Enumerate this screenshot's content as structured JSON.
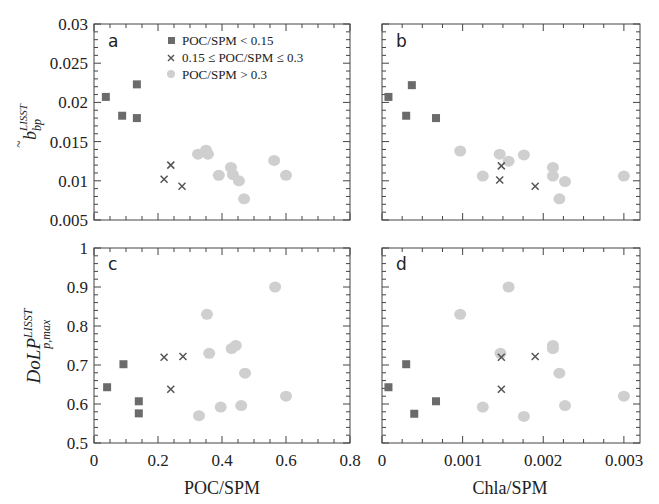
{
  "chart_data": [
    {
      "panel": "a",
      "type": "scatter",
      "xlabel": "",
      "ylabel": "b̃bp LISST",
      "xlim": [
        0,
        0.8
      ],
      "ylim": [
        0.005,
        0.03
      ],
      "xticks": [
        "0",
        "0.2",
        "0.4",
        "0.6",
        "0.8"
      ],
      "yticks": [
        "0.005",
        "0.01",
        "0.015",
        "0.02",
        "0.025",
        "0.03"
      ],
      "series": [
        {
          "name": "POC/SPM < 0.15",
          "marker": "square",
          "points": [
            [
              0.037,
              0.0207
            ],
            [
              0.088,
              0.0183
            ],
            [
              0.134,
              0.018
            ],
            [
              0.134,
              0.0223
            ]
          ]
        },
        {
          "name": "0.15 ≤ POC/SPM ≤ 0.3",
          "marker": "x",
          "points": [
            [
              0.219,
              0.0102
            ],
            [
              0.24,
              0.012
            ],
            [
              0.275,
              0.0093
            ]
          ]
        },
        {
          "name": "POC/SPM > 0.3",
          "marker": "circle",
          "points": [
            [
              0.325,
              0.0134
            ],
            [
              0.35,
              0.0139
            ],
            [
              0.356,
              0.0134
            ],
            [
              0.39,
              0.0107
            ],
            [
              0.428,
              0.0117
            ],
            [
              0.434,
              0.0108
            ],
            [
              0.453,
              0.01
            ],
            [
              0.469,
              0.0077
            ],
            [
              0.563,
              0.0126
            ],
            [
              0.6,
              0.0107
            ]
          ]
        }
      ]
    },
    {
      "panel": "b",
      "type": "scatter",
      "xlim": [
        0,
        0.0032
      ],
      "ylim": [
        0.005,
        0.03
      ],
      "series": [
        {
          "name": "POC/SPM < 0.15",
          "marker": "square",
          "points": [
            [
              8e-05,
              0.0207
            ],
            [
              0.00037,
              0.0222
            ],
            [
              0.0003,
              0.0183
            ],
            [
              0.00067,
              0.018
            ]
          ]
        },
        {
          "name": "0.15 ≤ POC/SPM ≤ 0.3",
          "marker": "x",
          "points": [
            [
              0.00148,
              0.0119
            ],
            [
              0.00146,
              0.0101
            ],
            [
              0.0019,
              0.0093
            ]
          ]
        },
        {
          "name": "POC/SPM > 0.3",
          "marker": "circle",
          "points": [
            [
              0.00097,
              0.0138
            ],
            [
              0.00125,
              0.0106
            ],
            [
              0.00146,
              0.0134
            ],
            [
              0.00157,
              0.0125
            ],
            [
              0.00176,
              0.0133
            ],
            [
              0.00212,
              0.0117
            ],
            [
              0.00212,
              0.0106
            ],
            [
              0.00227,
              0.0099
            ],
            [
              0.0022,
              0.0077
            ],
            [
              0.003,
              0.0106
            ]
          ]
        }
      ]
    },
    {
      "panel": "c",
      "type": "scatter",
      "xlabel": "POC/SPM",
      "ylabel": "DoLP p,max LISST",
      "xlim": [
        0,
        0.8
      ],
      "ylim": [
        0.5,
        1
      ],
      "xticks": [
        "0",
        "0.2",
        "0.4",
        "0.6",
        "0.8"
      ],
      "yticks": [
        "0.5",
        "0.6",
        "0.7",
        "0.8",
        "0.9",
        "1"
      ],
      "series": [
        {
          "name": "POC/SPM < 0.15",
          "marker": "square",
          "points": [
            [
              0.041,
              0.643
            ],
            [
              0.092,
              0.702
            ],
            [
              0.14,
              0.607
            ],
            [
              0.14,
              0.576
            ]
          ]
        },
        {
          "name": "0.15 ≤ POC/SPM ≤ 0.3",
          "marker": "x",
          "points": [
            [
              0.219,
              0.72
            ],
            [
              0.278,
              0.722
            ],
            [
              0.24,
              0.638
            ]
          ]
        },
        {
          "name": "POC/SPM > 0.3",
          "marker": "circle",
          "points": [
            [
              0.566,
              0.9
            ],
            [
              0.353,
              0.83
            ],
            [
              0.36,
              0.73
            ],
            [
              0.43,
              0.742
            ],
            [
              0.443,
              0.75
            ],
            [
              0.472,
              0.679
            ],
            [
              0.6,
              0.62
            ],
            [
              0.328,
              0.57
            ],
            [
              0.396,
              0.592
            ],
            [
              0.46,
              0.596
            ]
          ]
        }
      ]
    },
    {
      "panel": "d",
      "type": "scatter",
      "xlabel": "Chla/SPM",
      "xlim": [
        0,
        0.0032
      ],
      "ylim": [
        0.5,
        1
      ],
      "xticks": [
        "0",
        "0.001",
        "0.002",
        "0.003"
      ],
      "series": [
        {
          "name": "POC/SPM < 0.15",
          "marker": "square",
          "points": [
            [
              8e-05,
              0.643
            ],
            [
              0.0003,
              0.702
            ],
            [
              0.0004,
              0.575
            ],
            [
              0.00067,
              0.607
            ]
          ]
        },
        {
          "name": "0.15 ≤ POC/SPM ≤ 0.3",
          "marker": "x",
          "points": [
            [
              0.00148,
              0.72
            ],
            [
              0.0019,
              0.722
            ],
            [
              0.00148,
              0.638
            ]
          ]
        },
        {
          "name": "POC/SPM > 0.3",
          "marker": "circle",
          "points": [
            [
              0.00157,
              0.9
            ],
            [
              0.00097,
              0.83
            ],
            [
              0.00147,
              0.73
            ],
            [
              0.00212,
              0.75
            ],
            [
              0.00212,
              0.742
            ],
            [
              0.0022,
              0.679
            ],
            [
              0.003,
              0.62
            ],
            [
              0.00125,
              0.592
            ],
            [
              0.00176,
              0.568
            ],
            [
              0.00227,
              0.596
            ]
          ]
        }
      ]
    }
  ],
  "legend": {
    "items": [
      {
        "label": "POC/SPM < 0.15",
        "marker": "square",
        "color": "#6b6b6b"
      },
      {
        "label": "0.15 ≤ POC/SPM ≤ 0.3",
        "marker": "x",
        "color": "#555555"
      },
      {
        "label": "POC/SPM > 0.3",
        "marker": "circle",
        "color": "#cfcfcf"
      }
    ]
  },
  "panels": {
    "a": {
      "letter": "a"
    },
    "b": {
      "letter": "b"
    },
    "c": {
      "letter": "c"
    },
    "d": {
      "letter": "d"
    }
  },
  "axes": {
    "x_left_title": "POC/SPM",
    "x_right_title": "Chla/SPM",
    "y_top_main": "b",
    "y_top_sub": "bp",
    "y_top_sup": "LISST",
    "y_bottom_main": "DoLP",
    "y_bottom_sub": "p,max",
    "y_bottom_sup": "LISST",
    "top_yticks": [
      "0.03",
      "0.025",
      "0.02",
      "0.015",
      "0.01",
      "0.005"
    ],
    "bottom_yticks": [
      "1",
      "0.9",
      "0.8",
      "0.7",
      "0.6",
      "0.5"
    ],
    "left_xticks": [
      "0",
      "0.2",
      "0.4",
      "0.6",
      "0.8"
    ],
    "right_xticks": [
      "0",
      "0.001",
      "0.002",
      "0.003"
    ]
  },
  "colors": {
    "square": "#6b6b6b",
    "cross": "#555555",
    "circle": "#cfcfcf",
    "frame": "#444444"
  }
}
